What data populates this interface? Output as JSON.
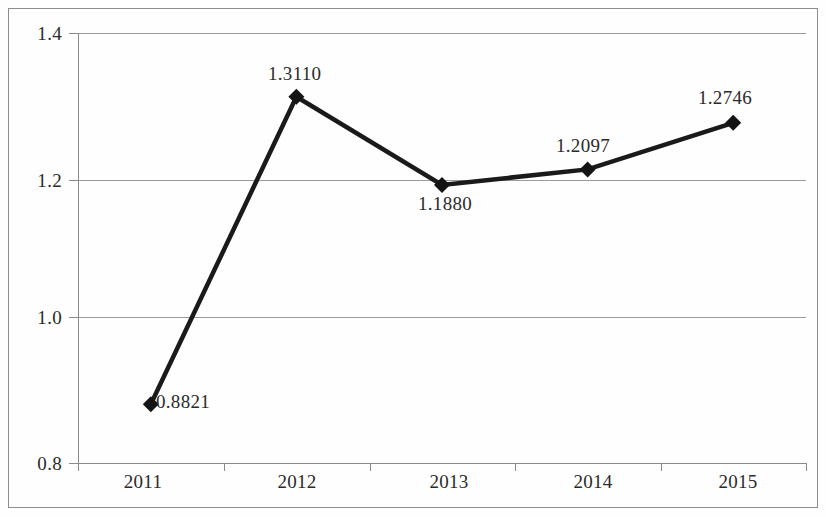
{
  "chart_data": {
    "type": "line",
    "title": "",
    "subtitle": "",
    "xlabel": "",
    "ylabel": "",
    "categories": [
      "2011",
      "2012",
      "2013",
      "2014",
      "2015"
    ],
    "values": [
      0.8821,
      1.311,
      1.188,
      1.2097,
      1.2746
    ],
    "data_labels": [
      "0.8821",
      "1.3110",
      "1.1880",
      "1.2097",
      "1.2746"
    ],
    "series": [
      {
        "name": "",
        "values": [
          0.8821,
          1.311,
          1.188,
          1.2097,
          1.2746
        ]
      }
    ],
    "ylim": [
      0.8,
      1.4
    ],
    "ytick_labels": [
      "0.8",
      "1.0",
      "1.2",
      "1.4"
    ],
    "ytick_values": [
      0.8,
      1.0,
      1.2,
      1.4
    ],
    "xtick_labels": [
      "2011",
      "2012",
      "2013",
      "2014",
      "2015"
    ],
    "grid": true,
    "grid_orientation": "horizontal",
    "legend": false,
    "legend_position": "none",
    "marker": "diamond",
    "line_color": "#1a1a1a",
    "marker_color": "#1a1a1a",
    "grid_color": "#9a9a9a",
    "text_color": "#2b2b2b",
    "background_color": "#fefefe",
    "annotations": []
  },
  "axes": {
    "y_ticks": [
      {
        "label": "1.4",
        "value": 1.4
      },
      {
        "label": "1.2",
        "value": 1.2
      },
      {
        "label": "1.0",
        "value": 1.0
      },
      {
        "label": "0.8",
        "value": 0.8
      }
    ],
    "x_ticks": [
      {
        "label": "2011"
      },
      {
        "label": "2012"
      },
      {
        "label": "2013"
      },
      {
        "label": "2014"
      },
      {
        "label": "2015"
      }
    ]
  },
  "points": [
    {
      "category": "2011",
      "label": "0.8821",
      "value": 0.8821
    },
    {
      "category": "2012",
      "label": "1.3110",
      "value": 1.311
    },
    {
      "category": "2013",
      "label": "1.1880",
      "value": 1.188
    },
    {
      "category": "2014",
      "label": "1.2097",
      "value": 1.2097
    },
    {
      "category": "2015",
      "label": "1.2746",
      "value": 1.2746
    }
  ]
}
